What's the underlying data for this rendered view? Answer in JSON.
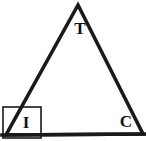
{
  "figure": {
    "type": "geometry-diagram",
    "shape": "triangle",
    "name": "triangle-TIC",
    "canvas": {
      "width": 146,
      "height": 141
    },
    "background_color": "#ffffff",
    "stroke_color": "#1a1a1a",
    "label_color": "#111111",
    "triangle": {
      "stroke_width": 3.6,
      "vertices": [
        {
          "label": "T",
          "x": 78,
          "y": 5,
          "label_x": 80,
          "label_y": 34,
          "font_size": 17
        },
        {
          "label": "I",
          "x": 6,
          "y": 135,
          "label_x": 26,
          "label_y": 128,
          "font_size": 17
        },
        {
          "label": "C",
          "x": 143,
          "y": 134,
          "label_x": 126,
          "label_y": 127,
          "font_size": 17
        }
      ],
      "base_extension": {
        "x1": 2,
        "y1": 135,
        "x2": 145,
        "y2": 134
      }
    },
    "highlight_box": {
      "name": "angle-I-highlight-box",
      "x": 3,
      "y": 107,
      "width": 38,
      "height": 31,
      "stroke_width": 1.6,
      "stroke_color": "#1a1a1a",
      "fill": "none"
    }
  }
}
